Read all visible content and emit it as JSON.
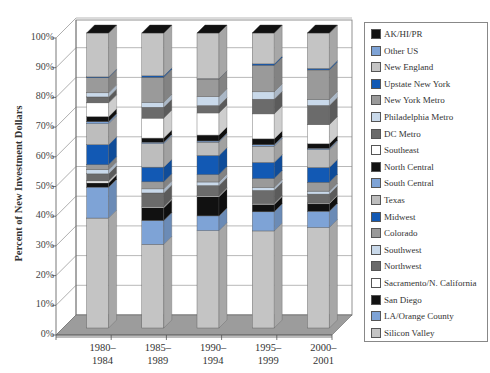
{
  "chart_data": {
    "type": "bar",
    "stacked": true,
    "three_d": true,
    "title": "",
    "xlabel": "",
    "ylabel": "Percent of New Investment Dollars",
    "ylim": [
      0,
      100
    ],
    "yticks": [
      "0%",
      "10%",
      "20%",
      "30%",
      "40%",
      "50%",
      "60%",
      "70%",
      "80%",
      "90%",
      "100%"
    ],
    "categories": [
      "1980–1984",
      "1985–1989",
      "1990–1994",
      "1995–1999",
      "2000–2001"
    ],
    "category_lines": [
      [
        "1980–",
        "1984"
      ],
      [
        "1985–",
        "1989"
      ],
      [
        "1990–",
        "1994"
      ],
      [
        "1995–",
        "1999"
      ],
      [
        "2000–",
        "2001"
      ]
    ],
    "legend_position": "right",
    "grid": true,
    "series": [
      {
        "name": "Silicon Valley",
        "color": "#c4c4c4",
        "values": [
          37.3,
          28.5,
          33.0,
          33.0,
          34.0
        ]
      },
      {
        "name": "LA/Orange County",
        "color": "#7ea3d6",
        "values": [
          10.5,
          8.1,
          5.0,
          6.5,
          5.5
        ]
      },
      {
        "name": "San Diego",
        "color": "#111111",
        "values": [
          1.4,
          4.4,
          6.5,
          2.5,
          2.5
        ]
      },
      {
        "name": "Sacramento/N. California",
        "color": "#ffffff",
        "values": [
          0.7,
          0.3,
          0.3,
          0.3,
          0.3
        ]
      },
      {
        "name": "Northwest",
        "color": "#6b6b6b",
        "values": [
          2.4,
          4.7,
          3.5,
          4.5,
          3.0
        ]
      },
      {
        "name": "Southwest",
        "color": "#c9d9ea",
        "values": [
          1.4,
          1.4,
          1.2,
          1.0,
          1.0
        ]
      },
      {
        "name": "Colorado",
        "color": "#9a9a9a",
        "values": [
          1.7,
          2.4,
          2.5,
          3.0,
          3.0
        ]
      },
      {
        "name": "Midwest",
        "color": "#1259b4",
        "values": [
          6.8,
          5.0,
          6.5,
          5.5,
          5.0
        ]
      },
      {
        "name": "Texas",
        "color": "#bdbdbd",
        "values": [
          7.1,
          8.0,
          4.5,
          5.5,
          6.0
        ]
      },
      {
        "name": "South Central",
        "color": "#7ea3d6",
        "values": [
          0.7,
          0.5,
          0.4,
          0.5,
          0.5
        ]
      },
      {
        "name": "North Central",
        "color": "#111111",
        "values": [
          1.7,
          1.4,
          2.0,
          2.0,
          1.5
        ]
      },
      {
        "name": "Southeast",
        "color": "#ffffff",
        "values": [
          4.7,
          6.8,
          7.5,
          8.5,
          6.5
        ]
      },
      {
        "name": "DC Metro",
        "color": "#6b6b6b",
        "values": [
          2.0,
          3.7,
          2.5,
          5.0,
          6.5
        ]
      },
      {
        "name": "Philadelphia Metro",
        "color": "#c9d9ea",
        "values": [
          1.4,
          1.7,
          3.0,
          2.5,
          2.0
        ]
      },
      {
        "name": "New York Metro",
        "color": "#9a9a9a",
        "values": [
          5.1,
          8.5,
          6.0,
          9.0,
          10.0
        ]
      },
      {
        "name": "Upstate New York",
        "color": "#1259b4",
        "values": [
          0.3,
          0.5,
          0.1,
          0.5,
          0.5
        ]
      },
      {
        "name": "New England",
        "color": "#c4c4c4",
        "values": [
          14.9,
          14.6,
          15.5,
          10.5,
          12.0
        ]
      },
      {
        "name": "Other US",
        "color": "#7ea3d6",
        "values": [
          0.0,
          0.0,
          0.0,
          0.0,
          0.0
        ]
      },
      {
        "name": "AK/HI/PR",
        "color": "#111111",
        "values": [
          0.0,
          0.0,
          0.0,
          0.0,
          0.0
        ]
      }
    ]
  },
  "legend": {
    "items": [
      {
        "label": "AK/HI/PR",
        "color": "#111111"
      },
      {
        "label": "Other US",
        "color": "#7ea3d6"
      },
      {
        "label": "New England",
        "color": "#c4c4c4"
      },
      {
        "label": "Upstate New York",
        "color": "#1259b4"
      },
      {
        "label": "New York Metro",
        "color": "#9a9a9a"
      },
      {
        "label": "Philadelphia Metro",
        "color": "#c9d9ea"
      },
      {
        "label": "DC Metro",
        "color": "#6b6b6b"
      },
      {
        "label": "Southeast",
        "color": "#ffffff"
      },
      {
        "label": "North Central",
        "color": "#111111"
      },
      {
        "label": "South Central",
        "color": "#7ea3d6"
      },
      {
        "label": "Texas",
        "color": "#bdbdbd"
      },
      {
        "label": "Midwest",
        "color": "#1259b4"
      },
      {
        "label": "Colorado",
        "color": "#9a9a9a"
      },
      {
        "label": "Southwest",
        "color": "#c9d9ea"
      },
      {
        "label": "Northwest",
        "color": "#6b6b6b"
      },
      {
        "label": "Sacramento/N. California",
        "color": "#ffffff"
      },
      {
        "label": "San Diego",
        "color": "#111111"
      },
      {
        "label": "LA/Orange County",
        "color": "#7ea3d6"
      },
      {
        "label": "Silicon Valley",
        "color": "#c4c4c4"
      }
    ]
  }
}
